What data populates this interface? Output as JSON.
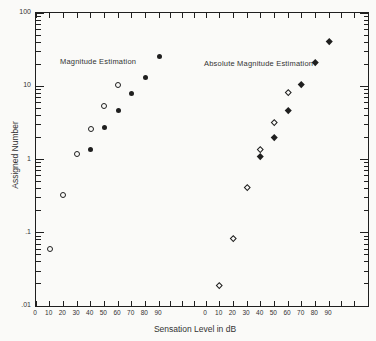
{
  "figure": {
    "ink": "#1f1f1f",
    "paper": "#fafaf8",
    "text": "#333333"
  },
  "chart_data": {
    "type": "scatter",
    "title": "",
    "xlabel": "Sensation Level in dB",
    "ylabel": "Assigned Number",
    "y_scale": "log",
    "ylim": [
      0.01,
      100
    ],
    "grid": false,
    "y_ticks": [
      {
        "label": "100",
        "value": 100
      },
      {
        "label": "10",
        "value": 10
      },
      {
        "label": "1",
        "value": 1
      },
      {
        "label": ".1",
        "value": 0.1
      },
      {
        "label": ".01",
        "value": 0.01
      }
    ],
    "x_dual_scales": {
      "left": {
        "labels": [
          "0",
          "10",
          "20",
          "30",
          "40",
          "50",
          "60",
          "70",
          "80",
          "90"
        ],
        "values": [
          0,
          10,
          20,
          30,
          40,
          50,
          60,
          70,
          80,
          90
        ]
      },
      "right": {
        "labels": [
          "0",
          "10",
          "20",
          "30",
          "40",
          "50",
          "60",
          "70",
          "80",
          "90"
        ],
        "values": [
          0,
          10,
          20,
          30,
          40,
          50,
          60,
          70,
          80,
          90
        ]
      }
    },
    "annotations": [
      {
        "text": "Magnitude Estimation",
        "scale": "left"
      },
      {
        "text": "Absolute Magnitude Estimation",
        "scale": "right"
      }
    ],
    "series": [
      {
        "name": "magnitude-estimation-open-circles",
        "legend": "Magnitude Estimation (open circles)",
        "marker": "circle-open",
        "scale": "left",
        "x": [
          10,
          20,
          30,
          40,
          50,
          60
        ],
        "y": [
          0.06,
          0.33,
          1.2,
          2.6,
          5.4,
          10.5
        ]
      },
      {
        "name": "magnitude-estimation-filled-circles",
        "legend": "Magnitude Estimation (filled circles)",
        "marker": "circle-filled",
        "scale": "left",
        "x": [
          40,
          50,
          60,
          70,
          80,
          90
        ],
        "y": [
          1.35,
          2.7,
          4.6,
          8.0,
          13.2,
          25.5
        ]
      },
      {
        "name": "absolute-magnitude-estimation-open-diamonds",
        "legend": "Absolute Magnitude Estimation (open diamonds)",
        "marker": "diamond-open",
        "scale": "right",
        "x": [
          10,
          20,
          30,
          40,
          50,
          60
        ],
        "y": [
          0.019,
          0.085,
          0.42,
          1.4,
          3.2,
          8.3
        ]
      },
      {
        "name": "absolute-magnitude-estimation-filled-diamonds",
        "legend": "Absolute Magnitude Estimation (filled diamonds)",
        "marker": "diamond-filled",
        "scale": "right",
        "x": [
          40,
          50,
          60,
          70,
          80,
          90
        ],
        "y": [
          1.1,
          2.0,
          4.7,
          10.8,
          21,
          41
        ]
      }
    ]
  }
}
